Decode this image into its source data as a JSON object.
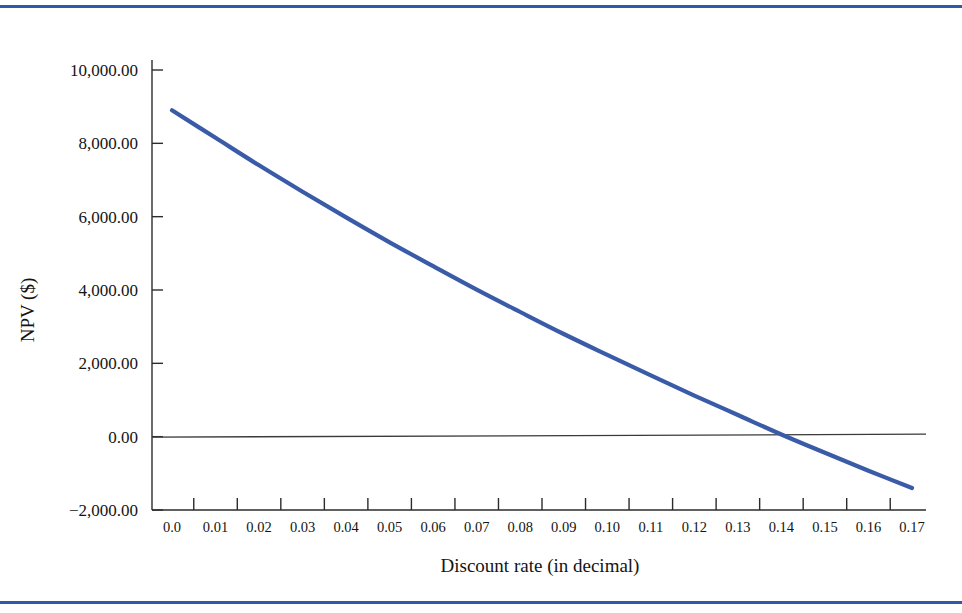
{
  "page": {
    "rule_color": "#2f5aa8",
    "background": "#ffffff"
  },
  "chart_data": {
    "type": "line",
    "title": "",
    "subtitle": "",
    "xlabel": "Discount rate (in decimal)",
    "ylabel": "NPV ($)",
    "line_color": "#3a5ba8",
    "zero_line_color": "#3a3a3a",
    "axis_color": "#2b2b2b",
    "grid": false,
    "legend": null,
    "xlim": [
      0.0,
      0.17
    ],
    "ylim": [
      -2000,
      10000
    ],
    "x_tick_labels": [
      "0.0",
      "0.01",
      "0.02",
      "0.03",
      "0.04",
      "0.05",
      "0.06",
      "0.07",
      "0.08",
      "0.09",
      "0.10",
      "0.11",
      "0.12",
      "0.13",
      "0.14",
      "0.15",
      "0.16",
      "0.17"
    ],
    "y_tick_labels": [
      "10,000.00",
      "8,000.00",
      "6,000.00",
      "4,000.00",
      "2,000.00",
      "0.00",
      "−2,000.00"
    ],
    "y_tick_values": [
      10000,
      8000,
      6000,
      4000,
      2000,
      0,
      -2000
    ],
    "x": [
      0.0,
      0.01,
      0.02,
      0.03,
      0.04,
      0.05,
      0.06,
      0.07,
      0.08,
      0.09,
      0.1,
      0.11,
      0.12,
      0.13,
      0.14,
      0.15,
      0.16,
      0.17
    ],
    "series": [
      {
        "name": "NPV",
        "values": [
          8900,
          8150,
          7400,
          6680,
          5980,
          5300,
          4650,
          4010,
          3400,
          2800,
          2230,
          1670,
          1120,
          590,
          60,
          -440,
          -930,
          -1400
        ]
      }
    ],
    "annotations": {
      "zero_crossing_x": 0.1351,
      "zero_crossing_note": "IRR ≈ 0.135"
    }
  }
}
